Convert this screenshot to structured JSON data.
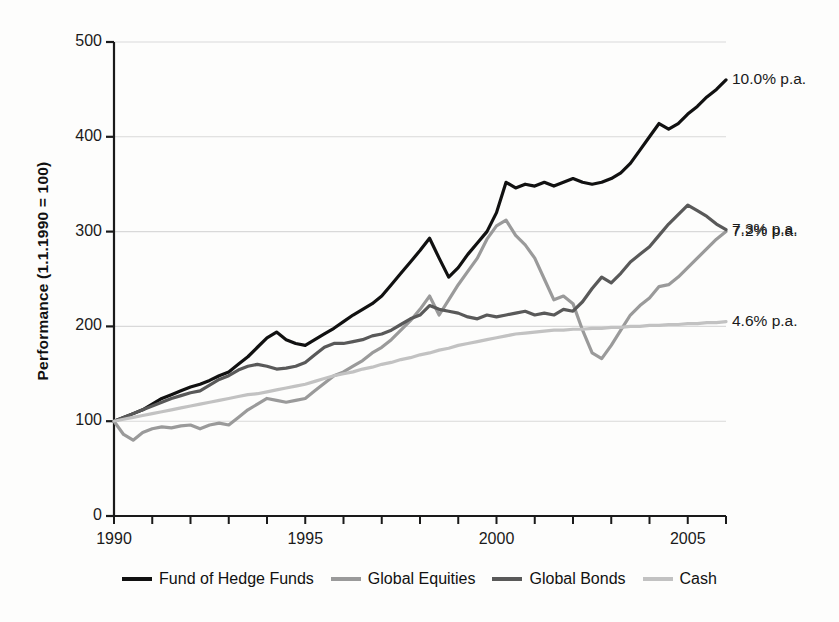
{
  "chart_data": {
    "type": "line",
    "title": "",
    "subtitle": "",
    "xlabel": "",
    "ylabel": "Performance (1.1.1990 = 100)",
    "xlim": [
      1990,
      2006
    ],
    "ylim": [
      0,
      500
    ],
    "yticks": [
      0,
      100,
      200,
      300,
      400,
      500
    ],
    "ytick_labels": [
      "0",
      "100",
      "200",
      "300",
      "400",
      "500"
    ],
    "xticks": [
      1990,
      1995,
      2000,
      2005
    ],
    "xtick_labels": [
      "1990",
      "1995",
      "2000",
      "2005"
    ],
    "x_minor_tick_interval": 1,
    "grid": "horizontal",
    "grid_color": "#d9d9d9",
    "legend_position": "bottom",
    "axis_color": "#1a1a1a",
    "background": "#fdfdfc",
    "annotations": [
      {
        "text": "10.0% p.a.",
        "series": "Fund of Hedge Funds",
        "value": 460,
        "x": 2006
      },
      {
        "text": "7.3% p.a.",
        "series": "Global Bonds",
        "value": 302,
        "x": 2006
      },
      {
        "text": "7.2% p.a.",
        "series": "Global Equities",
        "value": 300,
        "x": 2006
      },
      {
        "text": "4.6% p.a.",
        "series": "Cash",
        "value": 205,
        "x": 2006
      }
    ],
    "x": [
      1990.0,
      1990.25,
      1990.5,
      1990.75,
      1991.0,
      1991.25,
      1991.5,
      1991.75,
      1992.0,
      1992.25,
      1992.5,
      1992.75,
      1993.0,
      1993.25,
      1993.5,
      1993.75,
      1994.0,
      1994.25,
      1994.5,
      1994.75,
      1995.0,
      1995.25,
      1995.5,
      1995.75,
      1996.0,
      1996.25,
      1996.5,
      1996.75,
      1997.0,
      1997.25,
      1997.5,
      1997.75,
      1998.0,
      1998.25,
      1998.5,
      1998.75,
      1999.0,
      1999.25,
      1999.5,
      1999.75,
      2000.0,
      2000.25,
      2000.5,
      2000.75,
      2001.0,
      2001.25,
      2001.5,
      2001.75,
      2002.0,
      2002.25,
      2002.5,
      2002.75,
      2003.0,
      2003.25,
      2003.5,
      2003.75,
      2004.0,
      2004.25,
      2004.5,
      2004.75,
      2005.0,
      2005.25,
      2005.5,
      2005.75,
      2006.0
    ],
    "series": [
      {
        "name": "Fund of Hedge Funds",
        "color": "#111111",
        "width": 3.2,
        "final_value": 460,
        "cagr_label": "10.0% p.a.",
        "values": [
          100,
          104,
          108,
          112,
          118,
          124,
          128,
          132,
          136,
          139,
          143,
          148,
          152,
          160,
          168,
          178,
          188,
          194,
          186,
          182,
          180,
          186,
          192,
          198,
          205,
          212,
          218,
          224,
          232,
          244,
          256,
          268,
          280,
          293,
          272,
          252,
          262,
          276,
          288,
          300,
          320,
          352,
          346,
          350,
          348,
          352,
          348,
          352,
          356,
          352,
          350,
          352,
          356,
          362,
          372,
          386,
          400,
          414,
          408,
          414,
          424,
          432,
          442,
          450,
          460
        ]
      },
      {
        "name": "Global Equities",
        "color": "#9a9a9a",
        "width": 3.2,
        "final_value": 300,
        "cagr_label": "7.2% p.a.",
        "values": [
          100,
          86,
          80,
          88,
          92,
          94,
          93,
          95,
          96,
          92,
          96,
          98,
          96,
          104,
          112,
          118,
          124,
          122,
          120,
          122,
          124,
          132,
          140,
          148,
          152,
          158,
          164,
          172,
          178,
          186,
          196,
          206,
          218,
          232,
          212,
          228,
          244,
          258,
          272,
          292,
          306,
          312,
          296,
          286,
          272,
          250,
          228,
          232,
          224,
          196,
          172,
          166,
          180,
          196,
          212,
          222,
          230,
          242,
          244,
          252,
          262,
          272,
          282,
          292,
          300
        ]
      },
      {
        "name": "Global Bonds",
        "color": "#595959",
        "width": 3.2,
        "final_value": 302,
        "cagr_label": "7.3% p.a.",
        "values": [
          100,
          104,
          108,
          112,
          116,
          120,
          124,
          127,
          130,
          132,
          138,
          144,
          148,
          154,
          158,
          160,
          158,
          155,
          156,
          158,
          162,
          170,
          178,
          182,
          182,
          184,
          186,
          190,
          192,
          196,
          202,
          208,
          212,
          222,
          218,
          216,
          214,
          210,
          208,
          212,
          210,
          212,
          214,
          216,
          212,
          214,
          212,
          218,
          216,
          226,
          240,
          252,
          246,
          256,
          268,
          276,
          284,
          296,
          308,
          318,
          328,
          322,
          316,
          308,
          302
        ]
      },
      {
        "name": "Cash",
        "color": "#c2c2c2",
        "width": 3.2,
        "final_value": 205,
        "cagr_label": "4.6% p.a.",
        "values": [
          100,
          102,
          104,
          106,
          108,
          110,
          112,
          114,
          116,
          118,
          120,
          122,
          124,
          126,
          128,
          129,
          131,
          133,
          135,
          137,
          139,
          142,
          145,
          148,
          150,
          152,
          155,
          157,
          160,
          162,
          165,
          167,
          170,
          172,
          175,
          177,
          180,
          182,
          184,
          186,
          188,
          190,
          192,
          193,
          194,
          195,
          196,
          196,
          197,
          197,
          198,
          198,
          199,
          199,
          200,
          200,
          201,
          201,
          202,
          202,
          203,
          203,
          204,
          204,
          205
        ]
      }
    ]
  },
  "legend": {
    "items": [
      {
        "label": "Fund of Hedge Funds",
        "color": "#111111",
        "thickness": 4
      },
      {
        "label": "Global Equities",
        "color": "#9a9a9a",
        "thickness": 4
      },
      {
        "label": "Global Bonds",
        "color": "#595959",
        "thickness": 4
      },
      {
        "label": "Cash",
        "color": "#c2c2c2",
        "thickness": 4
      }
    ]
  }
}
